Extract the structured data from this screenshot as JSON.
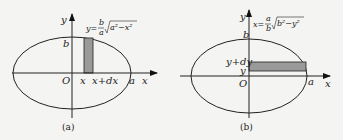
{
  "figures": [
    {
      "caption": "(a)",
      "axis_y": "y",
      "axis_x": "x",
      "origin": "O",
      "label_b": "b",
      "label_a": "a",
      "label_x": "x",
      "label_xdx": "x+dx",
      "formula_lhs": "y=",
      "formula_num": "b",
      "formula_den": "a",
      "formula_rad": "a²−x²",
      "strip_color": "#9a9a9a"
    },
    {
      "caption": "(b)",
      "axis_y": "y",
      "axis_x": "x",
      "origin": "O",
      "label_b": "b",
      "label_a": "a",
      "label_y": "y",
      "label_ydy": "y+dy",
      "formula_lhs": "x=",
      "formula_num": "a",
      "formula_den": "b",
      "formula_rad": "b²−y²",
      "strip_color": "#9a9a9a"
    }
  ]
}
